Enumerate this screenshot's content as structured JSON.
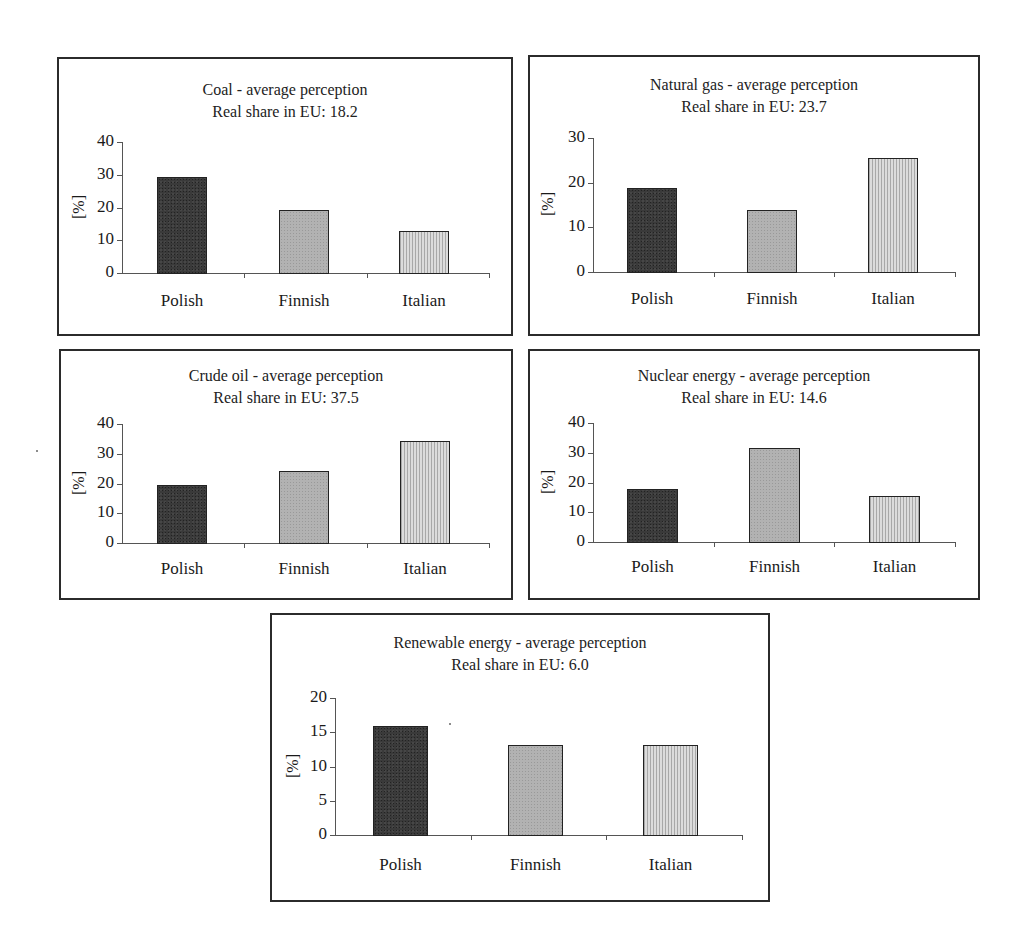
{
  "figure": {
    "panels": [
      {
        "id": "coal",
        "title": "Coal - average perception",
        "subtitle": "Real share in EU: 18.2"
      },
      {
        "id": "natural-gas",
        "title": "Natural gas - average perception",
        "subtitle": "Real share in EU: 23.7"
      },
      {
        "id": "crude-oil",
        "title": "Crude oil - average perception",
        "subtitle": "Real share in EU: 37.5"
      },
      {
        "id": "nuclear",
        "title": "Nuclear energy - average perception",
        "subtitle": "Real share in EU: 14.6"
      },
      {
        "id": "renewable",
        "title": "Renewable energy - average perception",
        "subtitle": "Real share in EU: 6.0"
      }
    ],
    "ylabel": "[%]",
    "categories": [
      "Polish",
      "Finnish",
      "Italian"
    ],
    "colors": {
      "polish": "#3a3a3a",
      "finnish": "#b2b2b2",
      "italian": "#d0d0d0"
    }
  },
  "chart_data": [
    {
      "type": "bar",
      "title": "Coal - average perception",
      "subtitle": "Real share in EU: 18.2",
      "categories": [
        "Polish",
        "Finnish",
        "Italian"
      ],
      "values": [
        29.3,
        19.2,
        12.8
      ],
      "xlabel": "",
      "ylabel": "[%]",
      "ylim": [
        0,
        40
      ],
      "yticks": [
        0,
        10,
        20,
        30,
        40
      ],
      "grid": false,
      "legend": null
    },
    {
      "type": "bar",
      "title": "Natural gas - average perception",
      "subtitle": "Real share in EU: 23.7",
      "categories": [
        "Polish",
        "Finnish",
        "Italian"
      ],
      "values": [
        18.8,
        13.9,
        25.6
      ],
      "xlabel": "",
      "ylabel": "[%]",
      "ylim": [
        0,
        30
      ],
      "yticks": [
        0,
        10,
        20,
        30
      ],
      "grid": false,
      "legend": null
    },
    {
      "type": "bar",
      "title": "Crude oil - average perception",
      "subtitle": "Real share in EU: 37.5",
      "categories": [
        "Polish",
        "Finnish",
        "Italian"
      ],
      "values": [
        19.6,
        24.1,
        34.2
      ],
      "xlabel": "",
      "ylabel": "[%]",
      "ylim": [
        0,
        40
      ],
      "yticks": [
        0,
        10,
        20,
        30,
        40
      ],
      "grid": false,
      "legend": null
    },
    {
      "type": "bar",
      "title": "Nuclear energy - average perception",
      "subtitle": "Real share in EU: 14.6",
      "categories": [
        "Polish",
        "Finnish",
        "Italian"
      ],
      "values": [
        17.7,
        31.6,
        15.4
      ],
      "xlabel": "",
      "ylabel": "[%]",
      "ylim": [
        0,
        40
      ],
      "yticks": [
        0,
        10,
        20,
        30,
        40
      ],
      "grid": false,
      "legend": null
    },
    {
      "type": "bar",
      "title": "Renewable energy - average perception",
      "subtitle": "Real share in EU: 6.0",
      "categories": [
        "Polish",
        "Finnish",
        "Italian"
      ],
      "values": [
        15.9,
        13.2,
        13.2
      ],
      "xlabel": "",
      "ylabel": "[%]",
      "ylim": [
        0,
        20
      ],
      "yticks": [
        0,
        5,
        10,
        15,
        20
      ],
      "grid": false,
      "legend": null
    }
  ]
}
